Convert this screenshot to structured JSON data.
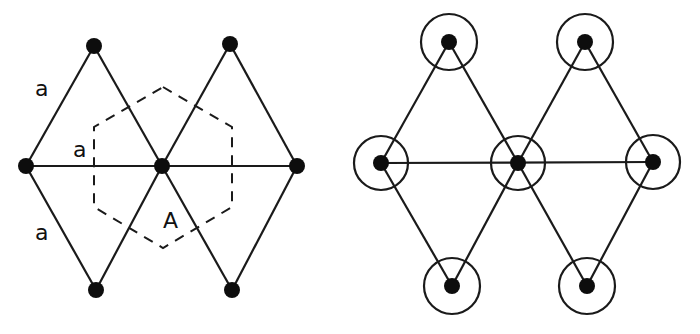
{
  "left_panel": {
    "description": "Rhombic lattice with dashed hexagonal cell around center atom",
    "labels": {
      "edge_top": "a",
      "edge_middle": "a",
      "edge_bottom": "a",
      "cell": "A"
    },
    "nodes": [
      {
        "x": 26,
        "y": 166
      },
      {
        "x": 162,
        "y": 166
      },
      {
        "x": 297,
        "y": 166
      },
      {
        "x": 94,
        "y": 46
      },
      {
        "x": 230,
        "y": 44
      },
      {
        "x": 96,
        "y": 290
      },
      {
        "x": 232,
        "y": 290
      }
    ],
    "hexagon": [
      [
        163,
        87
      ],
      [
        232,
        127
      ],
      [
        232,
        207
      ],
      [
        163,
        248
      ],
      [
        94,
        207
      ],
      [
        94,
        127
      ]
    ]
  },
  "right_panel": {
    "description": "Same lattice with circles around each atom",
    "nodes": [
      {
        "x": 381,
        "y": 163
      },
      {
        "x": 518,
        "y": 163
      },
      {
        "x": 653,
        "y": 162
      },
      {
        "x": 449,
        "y": 42
      },
      {
        "x": 585,
        "y": 42
      },
      {
        "x": 452,
        "y": 286
      },
      {
        "x": 587,
        "y": 286
      }
    ],
    "ring_radius": 28
  }
}
